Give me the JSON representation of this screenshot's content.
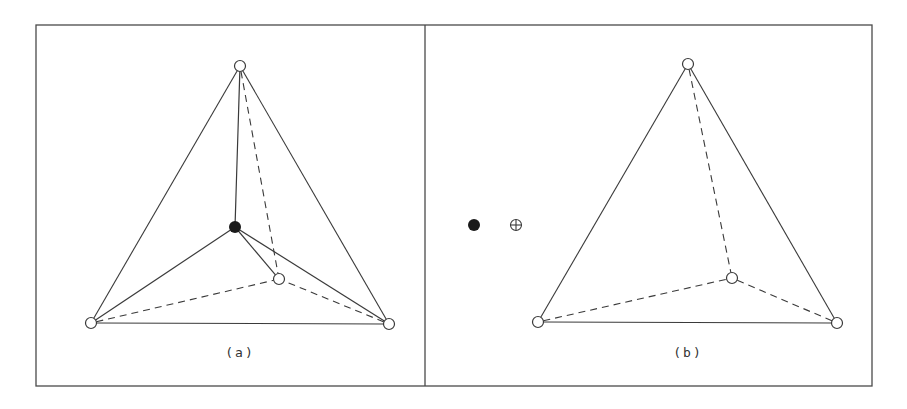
{
  "figure": {
    "colors": {
      "line": "#3a3a3a",
      "frame": "#4a4a4a",
      "filled_atom": "#1a1a1a",
      "open_atom_fill": "#ffffff",
      "background": "#ffffff"
    },
    "frame": {
      "left": 36,
      "top": 25,
      "right": 872,
      "bottom": 386,
      "divider_x": 425
    },
    "panels": [
      {
        "id": "a",
        "label": "(a)",
        "label_pos": [
          240,
          357
        ],
        "vertices": {
          "top": [
            240,
            66
          ],
          "bottom_left": [
            91,
            323
          ],
          "bottom_right": [
            389,
            324
          ],
          "inner": [
            279,
            279
          ]
        },
        "center_atom": [
          235,
          227
        ],
        "solid_edges": [
          [
            "top",
            "bottom_left"
          ],
          [
            "top",
            "bottom_right"
          ],
          [
            "bottom_left",
            "bottom_right"
          ]
        ],
        "dashed_edges": [
          [
            "top",
            "inner"
          ],
          [
            "bottom_left",
            "inner"
          ],
          [
            "bottom_right",
            "inner"
          ]
        ],
        "center_bonds": [
          "top",
          "bottom_left",
          "bottom_right",
          "inner"
        ]
      },
      {
        "id": "b",
        "label": "(b)",
        "label_pos": [
          688,
          357
        ],
        "vertices": {
          "top": [
            688,
            64
          ],
          "bottom_left": [
            538,
            322
          ],
          "bottom_right": [
            837,
            323
          ],
          "inner": [
            732,
            278
          ]
        },
        "solid_edges": [
          [
            "top",
            "bottom_left"
          ],
          [
            "top",
            "bottom_right"
          ],
          [
            "bottom_left",
            "bottom_right"
          ]
        ],
        "dashed_edges": [
          [
            "top",
            "inner"
          ],
          [
            "bottom_left",
            "inner"
          ],
          [
            "bottom_right",
            "inner"
          ]
        ]
      }
    ],
    "legend_symbols": [
      {
        "name": "filled-atom-symbol",
        "pos": [
          474,
          225
        ],
        "type": "filled-circle"
      },
      {
        "name": "crossed-circle-symbol",
        "pos": [
          516,
          225
        ],
        "type": "crossed-circle"
      }
    ]
  }
}
